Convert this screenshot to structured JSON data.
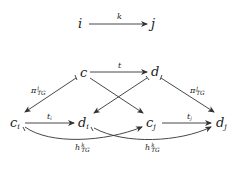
{
  "diagram": {
    "nodes": {
      "i": "i",
      "j": "j",
      "c": "c",
      "d": "d",
      "c_i": {
        "base": "c",
        "sub": "i"
      },
      "d_i": {
        "base": "d",
        "sub": "i"
      },
      "c_j": {
        "base": "c",
        "sub": "j"
      },
      "d_j": {
        "base": "d",
        "sub": "j"
      }
    },
    "edges": [
      {
        "from": "i",
        "to": "j",
        "label": "k"
      },
      {
        "from": "c",
        "to": "d",
        "label": "t"
      },
      {
        "from": "c",
        "to": "c_i",
        "label": {
          "base": "π",
          "sup": "i",
          "sub": "TG"
        }
      },
      {
        "from": "d",
        "to": "d_j",
        "label": {
          "base": "π",
          "sup": "j",
          "sub": "TG"
        }
      },
      {
        "from": "c",
        "to": "c_j",
        "label": ""
      },
      {
        "from": "d",
        "to": "d_i",
        "label": ""
      },
      {
        "from": "c_i",
        "to": "d_i",
        "label": {
          "base": "t",
          "sub": "i"
        }
      },
      {
        "from": "c_j",
        "to": "d_j",
        "label": {
          "base": "t",
          "sub": "j"
        }
      },
      {
        "from": "c_i",
        "to": "c_j",
        "label": {
          "base": "h",
          "sup": "k",
          "sub": "TG"
        }
      },
      {
        "from": "d_i",
        "to": "d_j",
        "label": {
          "base": "h",
          "sup": "k",
          "sub": "TG"
        }
      }
    ]
  }
}
